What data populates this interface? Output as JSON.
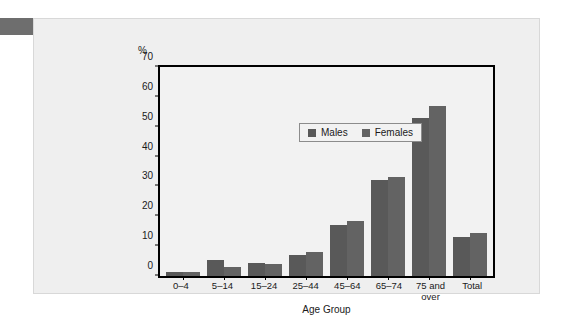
{
  "figure": {
    "y_axis_unit": "%",
    "x_axis_title": "Age Group"
  },
  "legend": {
    "items": [
      {
        "label": "Males",
        "color": "#595959"
      },
      {
        "label": "Females",
        "color": "#636363"
      }
    ]
  },
  "chart_data": {
    "type": "bar",
    "title": "",
    "subtitle": "",
    "xlabel": "Age Group",
    "ylabel": "%",
    "ylim": [
      0,
      70
    ],
    "yticks": [
      0,
      10,
      20,
      30,
      40,
      50,
      60,
      70
    ],
    "grid": false,
    "legend_position": "top-left inside plot",
    "categories": [
      "0–4",
      "5–14",
      "15–24",
      "25–44",
      "45–64",
      "65–74",
      "75 and over",
      "Total"
    ],
    "category_lines": [
      [
        "0–4"
      ],
      [
        "5–14"
      ],
      [
        "15–24"
      ],
      [
        "25–44"
      ],
      [
        "45–64"
      ],
      [
        "65–74"
      ],
      [
        "75 and",
        "over"
      ],
      [
        "Total"
      ]
    ],
    "series": [
      {
        "name": "Males",
        "color": "#595959",
        "values": [
          1.5,
          5.5,
          4.5,
          7,
          17,
          32,
          53,
          13
        ]
      },
      {
        "name": "Females",
        "color": "#636363",
        "values": [
          1.5,
          3,
          4,
          8,
          18.5,
          33,
          57,
          14.5
        ]
      }
    ]
  }
}
